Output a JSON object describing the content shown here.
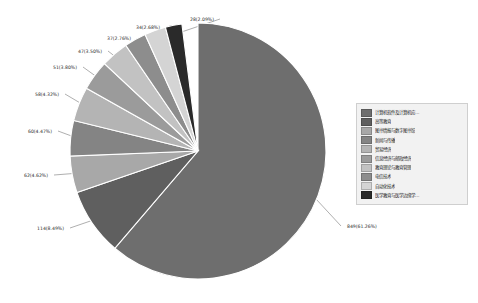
{
  "chart_data": {
    "type": "pie",
    "title": "",
    "legend_position": "right",
    "total": 1386,
    "categories": [
      "计算机软件及计算机应…",
      "高等教育",
      "图书情报与数字图书馆",
      "新闻与传播",
      "贸易经济",
      "信息经济与邮政经济",
      "教育理论与教育管理",
      "电信技术",
      "自动化技术",
      "医学教育与医学边缘学…"
    ],
    "values": [
      849,
      114,
      62,
      60,
      58,
      51,
      47,
      37,
      34,
      28
    ],
    "percents": [
      61.26,
      8.49,
      4.62,
      4.47,
      4.32,
      3.8,
      3.5,
      2.76,
      2.68,
      2.09
    ],
    "labels": [
      "849(61.26%)",
      "114(8.49%)",
      "62(4.62%)",
      "60(4.47%)",
      "58(4.32%)",
      "51(3.80%)",
      "47(3.50%)",
      "37(2.76%)",
      "34(2.68%)",
      "28(2.09%)"
    ],
    "colors": [
      "#6e6e6e",
      "#5f5f5f",
      "#a8a8a8",
      "#848484",
      "#b4b4b4",
      "#9b9b9b",
      "#c2c2c2",
      "#8d8d8d",
      "#d4d4d4",
      "#2a2a2a"
    ]
  },
  "legend": {
    "items": [
      {
        "label": "计算机软件及计算机应…",
        "color": "#6e6e6e"
      },
      {
        "label": "高等教育",
        "color": "#5f5f5f"
      },
      {
        "label": "图书情报与数字图书馆",
        "color": "#a8a8a8"
      },
      {
        "label": "新闻与传播",
        "color": "#848484"
      },
      {
        "label": "贸易经济",
        "color": "#b4b4b4"
      },
      {
        "label": "信息经济与邮政经济",
        "color": "#9b9b9b"
      },
      {
        "label": "教育理论与教育管理",
        "color": "#c2c2c2"
      },
      {
        "label": "电信技术",
        "color": "#8d8d8d"
      },
      {
        "label": "自动化技术",
        "color": "#d4d4d4"
      },
      {
        "label": "医学教育与医学边缘学…",
        "color": "#2a2a2a"
      }
    ]
  }
}
